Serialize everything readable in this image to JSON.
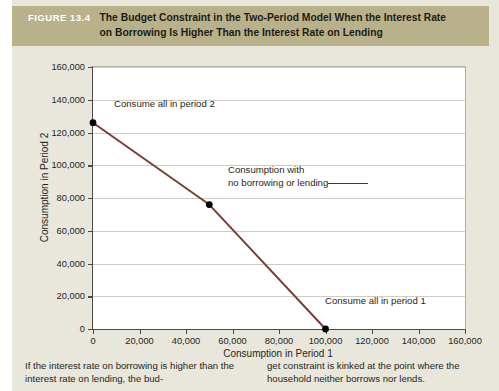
{
  "figure": {
    "number_label": "FIGURE 13.4",
    "title": "The Budget Constraint in the Two-Period Model When the Interest Rate on Borrowing Is Higher Than the Interest Rate on Lending",
    "band_color": "#b9b189",
    "paper_color": "#e9e7dc"
  },
  "caption": {
    "column_1": "If the interest rate on borrowing is higher than the interest rate on lending, the bud-",
    "column_2": "get constraint is kinked at the point where the household neither borrows nor lends."
  },
  "chart_data": {
    "type": "line",
    "title": "The Budget Constraint in the Two-Period Model When the Interest Rate on Borrowing Is Higher Than the Interest Rate on Lending",
    "xlabel": "Consumption in Period 1",
    "ylabel": "Consumption in Period 2",
    "xlim": [
      0,
      160000
    ],
    "ylim": [
      0,
      160000
    ],
    "xticks": [
      0,
      20000,
      40000,
      60000,
      80000,
      100000,
      120000,
      140000,
      160000
    ],
    "yticks": [
      0,
      20000,
      40000,
      60000,
      80000,
      100000,
      120000,
      140000,
      160000
    ],
    "xtick_labels": [
      "0",
      "20,000",
      "40,000",
      "60,000",
      "80,000",
      "100,000",
      "120,000",
      "140,000",
      "160,000"
    ],
    "ytick_labels": [
      "0",
      "20,000",
      "40,000",
      "60,000",
      "80,000",
      "100,000",
      "120,000",
      "140,000",
      "160,000"
    ],
    "grid": "horizontal",
    "legend": "none",
    "line_color": "#7a3a30",
    "marker_color": "#000000",
    "series": [
      {
        "name": "Budget constraint",
        "x": [
          0,
          50000,
          100000
        ],
        "y": [
          126000,
          76000,
          0
        ]
      }
    ],
    "markers": [
      {
        "x": 0,
        "y": 126000,
        "label": "Consume all in period 2"
      },
      {
        "x": 50000,
        "y": 76000,
        "label": "Consumption with no borrowing or lending"
      },
      {
        "x": 100000,
        "y": 0,
        "label": "Consume all in period 1"
      }
    ],
    "annotations": [
      {
        "id": "consume-all-period-2",
        "text": "Consume all in period 2"
      },
      {
        "id": "no-borrowing-lending-line1",
        "text": "Consumption with"
      },
      {
        "id": "no-borrowing-lending-line2",
        "text": "no borrowing or lending"
      },
      {
        "id": "consume-all-period-1",
        "text": "Consume all in period 1"
      }
    ]
  }
}
